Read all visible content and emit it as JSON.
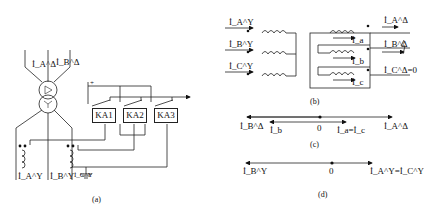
{
  "panel_a": {
    "caption": "(a)",
    "delta_currents": [
      "İ_A^Δ",
      "İ_B^Δ"
    ],
    "star_currents": [
      "İ_A^Y",
      "İ_B^Y",
      "İ_C^Y"
    ],
    "relays": [
      "KA1",
      "KA2",
      "KA3"
    ],
    "supply_sign": "+"
  },
  "panel_b": {
    "caption": "(b)",
    "primary_currents": [
      "İ_A^Y",
      "İ_B^Y",
      "İ_C^Y"
    ],
    "winding_currents": [
      "İ_a",
      "İ_b",
      "İ_c"
    ],
    "output_currents": [
      "İ_A^Δ",
      "İ_B^Δ",
      "İ_C^Δ=0"
    ]
  },
  "panel_c": {
    "caption": "(c)",
    "labels": [
      "İ_B^Δ",
      "İ_b",
      "0",
      "İ_a=İ_c",
      "İ_A^Δ"
    ]
  },
  "panel_d": {
    "caption": "(d)",
    "labels": [
      "İ_B^Y",
      "0",
      "İ_A^Y=İ_C^Y"
    ]
  }
}
